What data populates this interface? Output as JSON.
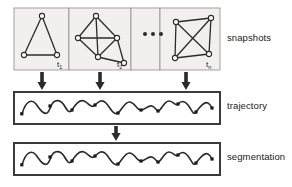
{
  "figure": {
    "width": 292,
    "height": 187,
    "colors": {
      "stroke": "#2b2b2b",
      "panel_fill": "#f2f0ee",
      "panel_border": "#8c8c8c",
      "box_border": "#3b3b3b",
      "node_fill": "#ffffff",
      "text": "#1a1a1a",
      "background": "#ffffff"
    }
  },
  "rows": {
    "snapshots": {
      "label": "snapshots",
      "box": {
        "x": 14,
        "y": 8,
        "width": 206,
        "height": 62
      },
      "panels": [
        {
          "name": "snapshot-t1",
          "time_label": "t",
          "time_sub": "1",
          "x": 14,
          "y": 8,
          "width": 55,
          "height": 62,
          "graph": {
            "nodes": [
              {
                "id": "a",
                "x": 42,
                "y": 16
              },
              {
                "id": "b",
                "x": 24,
                "y": 55
              },
              {
                "id": "c",
                "x": 57,
                "y": 55
              }
            ],
            "edges": [
              [
                "a",
                "b"
              ],
              [
                "a",
                "c"
              ],
              [
                "b",
                "c"
              ]
            ]
          }
        },
        {
          "name": "snapshot-t2",
          "time_label": "t",
          "time_sub": "2",
          "x": 69,
          "y": 8,
          "width": 62,
          "height": 62,
          "graph": {
            "nodes": [
              {
                "id": "a",
                "x": 96,
                "y": 16
              },
              {
                "id": "b",
                "x": 78,
                "y": 38
              },
              {
                "id": "c",
                "x": 117,
                "y": 38
              },
              {
                "id": "d",
                "x": 98,
                "y": 57
              },
              {
                "id": "e",
                "x": 124,
                "y": 63
              }
            ],
            "edges": [
              [
                "a",
                "b"
              ],
              [
                "a",
                "c"
              ],
              [
                "a",
                "d"
              ],
              [
                "b",
                "c"
              ],
              [
                "b",
                "d"
              ],
              [
                "c",
                "d"
              ],
              [
                "c",
                "e"
              ],
              [
                "d",
                "e"
              ]
            ]
          }
        },
        {
          "name": "snapshot-ellipsis",
          "time_label": "",
          "time_sub": "",
          "x": 131,
          "y": 8,
          "width": 29,
          "height": 62,
          "graph": {
            "nodes": [],
            "edges": []
          },
          "ellipsis": true
        },
        {
          "name": "snapshot-tn",
          "time_label": "t",
          "time_sub": "n",
          "x": 160,
          "y": 8,
          "width": 60,
          "height": 62,
          "graph": {
            "nodes": [
              {
                "id": "a",
                "x": 176,
                "y": 22
              },
              {
                "id": "b",
                "x": 211,
                "y": 18
              },
              {
                "id": "c",
                "x": 175,
                "y": 58
              },
              {
                "id": "d",
                "x": 209,
                "y": 54
              }
            ],
            "edges": [
              [
                "a",
                "b"
              ],
              [
                "a",
                "c"
              ],
              [
                "a",
                "d"
              ],
              [
                "b",
                "c"
              ],
              [
                "b",
                "d"
              ],
              [
                "c",
                "d"
              ]
            ]
          }
        }
      ]
    },
    "trajectory": {
      "label": "trajectory",
      "box": {
        "x": 14,
        "y": 92,
        "width": 206,
        "height": 32
      },
      "wave": {
        "baseline_y": 110,
        "amplitude": 9,
        "x_start": 22,
        "x_end": 212,
        "cycles": 7.5,
        "markers": [
          {
            "x": 22,
            "y": 114
          },
          {
            "x": 50,
            "y": 106
          },
          {
            "x": 72,
            "y": 110
          },
          {
            "x": 95,
            "y": 105
          },
          {
            "x": 118,
            "y": 113
          },
          {
            "x": 141,
            "y": 110
          },
          {
            "x": 158,
            "y": 111
          },
          {
            "x": 178,
            "y": 104
          },
          {
            "x": 196,
            "y": 112
          },
          {
            "x": 212,
            "y": 108
          }
        ]
      }
    },
    "segmentation": {
      "label": "segmentation",
      "box": {
        "x": 14,
        "y": 143,
        "width": 206,
        "height": 32
      },
      "wave": {
        "baseline_y": 161,
        "amplitude": 9,
        "x_start": 22,
        "x_end": 212,
        "cycles": 7.5,
        "markers": [
          {
            "x": 22,
            "y": 165
          },
          {
            "x": 50,
            "y": 157
          },
          {
            "x": 72,
            "y": 161
          },
          {
            "x": 95,
            "y": 156
          },
          {
            "x": 118,
            "y": 164
          },
          {
            "x": 141,
            "y": 161
          },
          {
            "x": 158,
            "y": 162
          },
          {
            "x": 178,
            "y": 155
          },
          {
            "x": 196,
            "y": 163
          },
          {
            "x": 212,
            "y": 159
          }
        ]
      }
    }
  },
  "arrows": {
    "snapshots_to_trajectory": [
      {
        "name": "arrow-t1-down",
        "x": 42,
        "y_top": 72,
        "y_bottom": 90
      },
      {
        "name": "arrow-t2-down",
        "x": 100,
        "y_top": 72,
        "y_bottom": 90
      },
      {
        "name": "arrow-tn-down",
        "x": 186,
        "y_top": 72,
        "y_bottom": 90
      }
    ],
    "trajectory_to_segmentation": [
      {
        "name": "arrow-trajectory-down",
        "x": 116,
        "y_top": 126,
        "y_bottom": 141
      }
    ]
  }
}
